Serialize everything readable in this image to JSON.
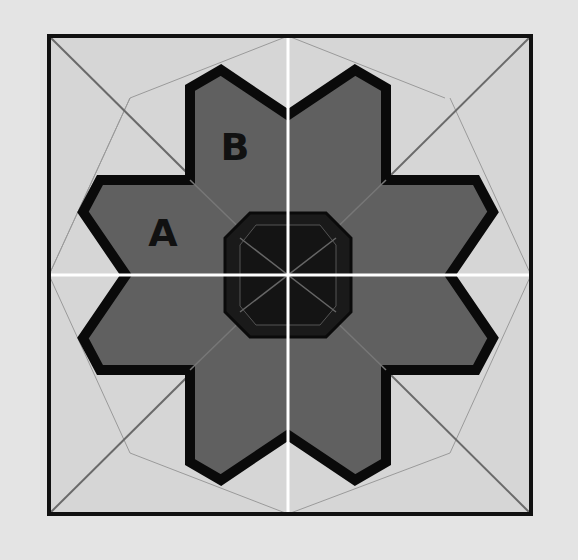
{
  "diagram": {
    "type": "quilt-block-pattern",
    "colors": {
      "page_background": "#e4e4e4",
      "block_background": "#d6d6d6",
      "star_fill": "#606060",
      "star_outline": "#0a0a0a",
      "octagon_fill": "#1a1a1a",
      "octagon_inner": "#141414",
      "seam_lines": "#777777",
      "quadrant_dividers": "#ffffff",
      "border": "#111111"
    },
    "labels": [
      {
        "id": "A",
        "text": "A",
        "x": 163,
        "y": 246
      },
      {
        "id": "B",
        "text": "B",
        "x": 235,
        "y": 160
      }
    ],
    "geometry": {
      "block": {
        "x": 49,
        "y": 36,
        "width": 482,
        "height": 478
      },
      "center": {
        "x": 288,
        "y": 275
      }
    }
  }
}
